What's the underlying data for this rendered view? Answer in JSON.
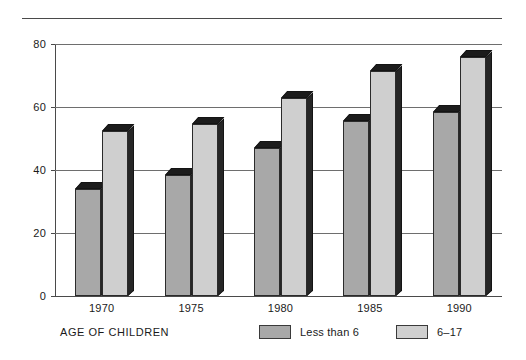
{
  "chart_data": {
    "type": "bar",
    "title": "",
    "subtitle": "",
    "xlabel": "AGE OF CHILDREN",
    "ylabel": "",
    "categories": [
      "1970",
      "1975",
      "1980",
      "1985",
      "1990"
    ],
    "series": [
      {
        "name": "Less than 6",
        "values": [
          34,
          38.5,
          47,
          55.5,
          58.5
        ],
        "color": "#a8a8a8"
      },
      {
        "name": "6–17",
        "values": [
          52.5,
          54.5,
          63,
          71.5,
          76
        ],
        "color": "#cfcfcf"
      }
    ],
    "ylim": [
      0,
      80
    ],
    "yticks": [
      0,
      20,
      40,
      60,
      80
    ],
    "ytick_labels": [
      "0",
      "20",
      "40",
      "60",
      "80"
    ],
    "grid": true,
    "grid_axis": "y",
    "legend_position": "bottom",
    "style_3d": true
  },
  "axis": {
    "x_title": "AGE OF CHILDREN",
    "y_tick_labels": [
      "80",
      "60",
      "40",
      "20",
      "0"
    ],
    "x_tick_labels": [
      "1970",
      "1975",
      "1980",
      "1985",
      "1990"
    ]
  },
  "legend": {
    "entries": [
      {
        "label": "Less than 6",
        "swatch": "dark-gray-swatch"
      },
      {
        "label": "6–17",
        "swatch": "light-gray-swatch"
      }
    ]
  },
  "colors": {
    "series_less_than_6": "#a8a8a8",
    "series_6_17": "#cfcfcf",
    "axis": "#4a4a4a",
    "gridline": "#6e6e6e",
    "bar_outline": "#2b2b2b",
    "background": "#ffffff"
  }
}
